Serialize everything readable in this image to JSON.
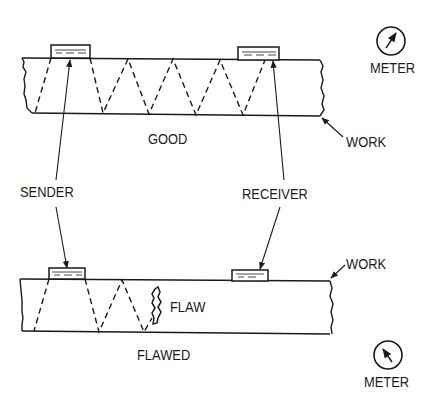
{
  "diagram": {
    "colors": {
      "ink": "#1a1a1a",
      "background": "#ffffff"
    },
    "good_panel": {
      "label": "GOOD",
      "work_label": "WORK",
      "meter_label": "METER",
      "meter_state": "deflected (signal received)"
    },
    "shared_labels": {
      "sender": "SENDER",
      "receiver": "RECEIVER"
    },
    "flawed_panel": {
      "label": "FLAWED",
      "work_label": "WORK",
      "flaw_label": "FLAW",
      "meter_label": "METER",
      "meter_state": "no deflection (signal blocked)"
    },
    "icons": {
      "meter_top": "meter-dial-icon",
      "meter_bottom": "meter-dial-icon"
    }
  }
}
